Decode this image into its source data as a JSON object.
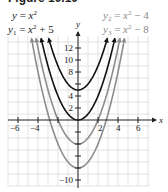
{
  "figure": {
    "title": "Figure 10.10"
  },
  "legend": {
    "y": {
      "lhs": "y",
      "expr": "x",
      "exp": "2",
      "rest": ""
    },
    "y1": {
      "lhs": "y",
      "sub": "1",
      "expr": "x",
      "exp": "2",
      "rest": " + 5"
    },
    "y2": {
      "lhs": "y",
      "sub": "2",
      "expr": "x",
      "exp": "2",
      "rest": " − 4"
    },
    "y3": {
      "lhs": "y",
      "sub": "3",
      "expr": "x",
      "exp": "2",
      "rest": " − 8"
    }
  },
  "colors": {
    "black_curve": "#111111",
    "gray_curve": "#8c8c8c",
    "grid": "#dcdcdc",
    "axis": "#222222"
  },
  "chart_data": {
    "type": "line",
    "title": "",
    "xlabel": "x",
    "ylabel": "y",
    "xlim": [
      -7,
      7
    ],
    "ylim": [
      -11,
      14
    ],
    "grid": true,
    "x_ticks": [
      -6,
      -4,
      -2,
      2,
      4,
      6
    ],
    "y_ticks": [
      -10,
      2,
      4,
      8,
      10,
      12
    ],
    "x_tick_labels": [
      "−6",
      "−4",
      "2",
      "4",
      "6"
    ],
    "y_tick_labels": [
      "12",
      "10",
      "8",
      "4",
      "2",
      "−10"
    ],
    "series": [
      {
        "name": "y = x^2",
        "formula": "x^2",
        "shift": 0,
        "color": "black"
      },
      {
        "name": "y1 = x^2 + 5",
        "formula": "x^2 + 5",
        "shift": 5,
        "color": "black"
      },
      {
        "name": "y2 = x^2 - 4",
        "formula": "x^2 - 4",
        "shift": -4,
        "color": "gray"
      },
      {
        "name": "y3 = x^2 - 8",
        "formula": "x^2 - 8",
        "shift": -8,
        "color": "gray"
      }
    ],
    "legend_position": "top"
  }
}
